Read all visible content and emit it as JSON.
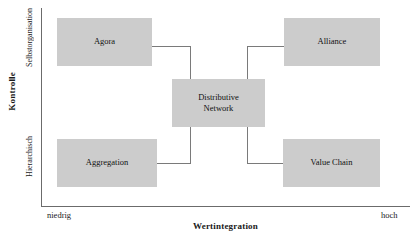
{
  "chart_data": {
    "type": "diagram",
    "title": "",
    "xlabel": "Wertintegration",
    "ylabel": "Kontrolle",
    "x_tick_labels": [
      "niedrig",
      "hoch"
    ],
    "y_tick_labels": [
      "Hierarchisch",
      "Selbstorganisation"
    ],
    "grid": false,
    "legend": "none",
    "node_fill_color": "#cccccc",
    "axis_color": "#6b6b6b",
    "connector_color": "#7a7a7a",
    "nodes": [
      {
        "id": "agora",
        "label": "Agora",
        "x": "low",
        "y": "high"
      },
      {
        "id": "alliance",
        "label": "Alliance",
        "x": "high",
        "y": "high"
      },
      {
        "id": "center",
        "label": "Distributive\nNetwork",
        "x": "middle",
        "y": "middle"
      },
      {
        "id": "aggregation",
        "label": "Aggregation",
        "x": "low",
        "y": "low"
      },
      {
        "id": "valuechain",
        "label": "Value Chain",
        "x": "high",
        "y": "low"
      }
    ],
    "edges": [
      {
        "from": "agora",
        "to": "center"
      },
      {
        "from": "alliance",
        "to": "center"
      },
      {
        "from": "aggregation",
        "to": "center"
      },
      {
        "from": "valuechain",
        "to": "center"
      }
    ]
  },
  "axes": {
    "y": {
      "title": "Kontrolle",
      "top_label": "Selbstorganisation",
      "bottom_label": "Hierarchisch"
    },
    "x": {
      "title": "Wertintegration",
      "left_label": "niedrig",
      "right_label": "hoch"
    }
  },
  "boxes": {
    "agora": "Agora",
    "alliance": "Alliance",
    "center": "Distributive\nNetwork",
    "aggregation": "Aggregation",
    "valuechain": "Value Chain"
  }
}
